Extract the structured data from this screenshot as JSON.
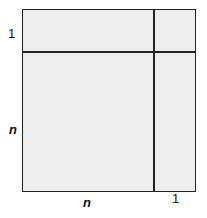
{
  "diagram": {
    "fill_color": "#ededed",
    "line_color": "#222222",
    "labels": {
      "left_top": "1",
      "left_middle": "n",
      "bottom_middle": "n",
      "bottom_right": "1"
    }
  }
}
